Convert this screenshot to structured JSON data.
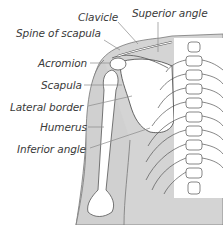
{
  "diagram": {
    "labels": [
      {
        "id": "clavicle",
        "text": "Clavicle"
      },
      {
        "id": "superior_angle",
        "text": "Superior angle"
      },
      {
        "id": "spine_of_scapula",
        "text": "Spine of scapula"
      },
      {
        "id": "acromion",
        "text": "Acromion"
      },
      {
        "id": "scapula",
        "text": "Scapula"
      },
      {
        "id": "lateral_border",
        "text": "Lateral border"
      },
      {
        "id": "humerus",
        "text": "Humerus"
      },
      {
        "id": "inferior_angle",
        "text": "Inferior angle"
      }
    ],
    "colors": {
      "skin": "#d4d4d4",
      "bone": "#ffffff",
      "outline": "#555555",
      "leader": "#8a8a8a",
      "text": "#3a3a3a"
    }
  }
}
